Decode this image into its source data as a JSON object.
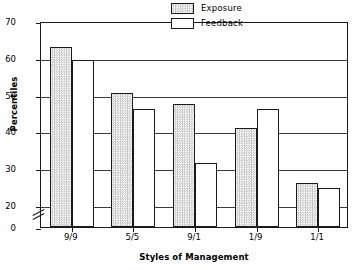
{
  "chart_data": {
    "type": "bar",
    "title": "",
    "xlabel": "Styles of Management",
    "ylabel": "Percentiles",
    "categories": [
      "9/9",
      "5/5",
      "9/1",
      "1/9",
      "1/1"
    ],
    "series": [
      {
        "name": "Exposure",
        "values": [
          63,
          50.5,
          47.5,
          41,
          26
        ]
      },
      {
        "name": "Feedback",
        "values": [
          59.5,
          46,
          31.5,
          46,
          24.5
        ]
      }
    ],
    "ylim": [
      20,
      70
    ],
    "yticks": [
      0,
      20,
      30,
      40,
      50,
      60,
      70
    ],
    "ytick_labels": [
      "0",
      "20",
      "30",
      "40",
      "50",
      "60",
      "70"
    ],
    "axis_break": true,
    "axis_break_between": [
      0,
      20
    ],
    "grid": true,
    "grid_axis": "y",
    "legend_position": "top-right-inside",
    "legend": [
      {
        "label": "Exposure",
        "fill": "checkered-gray",
        "color": "#c4c4c4"
      },
      {
        "label": "Feedback",
        "fill": "solid-white",
        "color": "#ffffff"
      }
    ],
    "colors": {
      "axis": "#1a1a1a",
      "grid": "#3b3b3b",
      "exposure_fill": "#c4c4c4",
      "feedback_fill": "#ffffff",
      "background": "#ffffff"
    }
  }
}
